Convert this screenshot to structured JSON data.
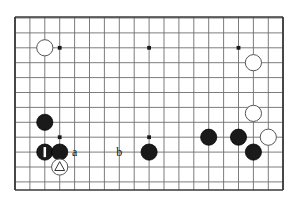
{
  "diagram": {
    "kind": "go-board-diagram",
    "board_size": 19,
    "visible_region": {
      "columns": 18,
      "rows": 12,
      "description": "bottom-left portion of a 19x19 go board, top and bottom edges shown"
    },
    "colors": {
      "background": "#ffffff",
      "board_fill": "#ffffff",
      "grid_line": "#6e6e6e",
      "border_line": "#3a3a3a",
      "star_point": "#1a1a1a",
      "black_stone": "#1a1a1a",
      "black_stone_edge": "#000000",
      "white_stone": "#ffffff",
      "white_stone_edge": "#555555",
      "label_text": "#111111",
      "marker_light": "#ffffff",
      "marker_dark": "#333333"
    },
    "geometry": {
      "origin_x": 15,
      "origin_y": 18,
      "spacing_x": 14.9,
      "spacing_y": 14.9,
      "stone_radius": 8.1,
      "star_radius": 1.9,
      "border_left_x": 15,
      "border_right_x": 283,
      "border_top_y": 17,
      "border_bottom_y": 190
    },
    "star_points": [
      {
        "col": 3,
        "row": 2
      },
      {
        "col": 9,
        "row": 2
      },
      {
        "col": 15,
        "row": 2
      },
      {
        "col": 3,
        "row": 8
      },
      {
        "col": 9,
        "row": 8
      }
    ],
    "stones": [
      {
        "color": "white",
        "col": 2,
        "row": 2,
        "marker": "none"
      },
      {
        "color": "white",
        "col": 16,
        "row": 3,
        "marker": "none"
      },
      {
        "color": "white",
        "col": 16,
        "row": 6.4,
        "marker": "none"
      },
      {
        "color": "white",
        "col": 17,
        "row": 8,
        "marker": "none"
      },
      {
        "color": "black",
        "col": 2,
        "row": 7,
        "marker": "none"
      },
      {
        "color": "black",
        "col": 2,
        "row": 9,
        "marker": "move-1"
      },
      {
        "color": "black",
        "col": 3,
        "row": 9,
        "marker": "none"
      },
      {
        "color": "black",
        "col": 9,
        "row": 9,
        "marker": "none"
      },
      {
        "color": "black",
        "col": 13,
        "row": 8,
        "marker": "none"
      },
      {
        "color": "black",
        "col": 15,
        "row": 8,
        "marker": "none"
      },
      {
        "color": "black",
        "col": 16,
        "row": 9,
        "marker": "none"
      },
      {
        "color": "white",
        "col": 3,
        "row": 10,
        "marker": "triangle"
      }
    ],
    "point_labels": [
      {
        "text": "a",
        "col": 4,
        "row": 9
      },
      {
        "text": "b",
        "col": 7,
        "row": 9
      }
    ]
  }
}
